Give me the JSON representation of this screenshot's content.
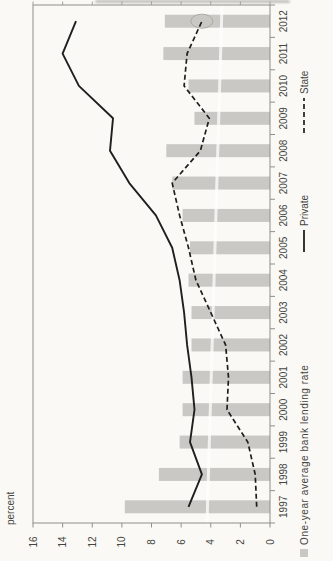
{
  "chart_data": {
    "type": "combo",
    "categories": [
      "1997",
      "1998",
      "1999",
      "2000",
      "2001",
      "2002",
      "2003",
      "2004",
      "2005",
      "2006",
      "2007",
      "2008",
      "2009",
      "2010",
      "2011",
      "2012"
    ],
    "series": [
      {
        "name": "One-year average bank lending rate",
        "type": "bar",
        "values": [
          9.8,
          7.5,
          6.1,
          5.9,
          5.9,
          5.3,
          5.3,
          5.5,
          5.4,
          5.9,
          6.6,
          7.0,
          5.1,
          5.5,
          7.2,
          7.1
        ]
      },
      {
        "name": "Private",
        "type": "line",
        "line_style": "solid",
        "values": [
          5.5,
          4.6,
          5.4,
          5.1,
          5.3,
          5.6,
          5.8,
          6.1,
          6.6,
          7.7,
          9.5,
          10.8,
          10.6,
          12.9,
          14.0,
          13.1
        ]
      },
      {
        "name": "State",
        "type": "line",
        "line_style": "dashed",
        "values": [
          0.9,
          1.0,
          1.5,
          2.9,
          2.8,
          3.0,
          4.0,
          5.0,
          5.5,
          6.1,
          6.6,
          4.7,
          4.1,
          5.8,
          5.6,
          4.6
        ]
      }
    ],
    "ylabel": "percent",
    "ylim": [
      0,
      16
    ],
    "yticks": [
      0,
      2,
      4,
      6,
      8,
      10,
      12,
      14,
      16
    ],
    "grid": false,
    "legend_position": "bottom",
    "orientation": "rotated-90-ccw",
    "annotations": [
      {
        "type": "ellipse",
        "series": "State",
        "category": "2012",
        "value": 4.6
      }
    ],
    "colors": {
      "bar": "#c9c8c4",
      "line": "#1f1f1f",
      "border": "#8e8e8c",
      "text": "#45443f",
      "background": "#faf9f5"
    }
  }
}
